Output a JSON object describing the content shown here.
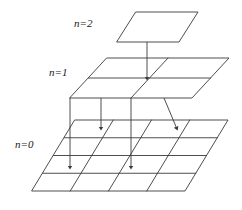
{
  "figure": {
    "background_color": "#ffffff",
    "line_color": "#3a3a3a",
    "text_color": "#1a1a1a"
  },
  "labels": [
    {
      "id": "n2",
      "variable": "n",
      "equals": "=",
      "value": "2",
      "text": "n=2"
    },
    {
      "id": "n1",
      "variable": "n",
      "equals": "=",
      "value": "1",
      "text": "n=1"
    },
    {
      "id": "n0",
      "variable": "n",
      "equals": "=",
      "value": "0",
      "text": "n=0"
    }
  ],
  "planes": [
    {
      "id": "n2",
      "level": 2,
      "divisions": 1,
      "cells": 1,
      "corners": {
        "top_left": [
          136,
          12
        ],
        "top_right": [
          198,
          12
        ],
        "bottom_right": [
          179,
          42
        ],
        "bottom_left": [
          117,
          42
        ]
      }
    },
    {
      "id": "n1",
      "level": 1,
      "divisions": 2,
      "cells": 4,
      "corners": {
        "top_left": [
          107,
          58
        ],
        "top_right": [
          229,
          58
        ],
        "bottom_right": [
          192,
          98
        ],
        "bottom_left": [
          70,
          98
        ]
      }
    },
    {
      "id": "n0",
      "level": 0,
      "divisions": 4,
      "cells": 16,
      "corners": {
        "top_left": [
          75,
          120
        ],
        "top_right": [
          228,
          120
        ],
        "bottom_right": [
          185,
          191
        ],
        "bottom_left": [
          32,
          191
        ]
      }
    }
  ],
  "arrows": [
    {
      "id": "arrow-n2-to-n1",
      "from": [
        147,
        42
      ],
      "to": [
        147,
        79
      ]
    },
    {
      "id": "arrow-n1-to-n0-a",
      "from": [
        70,
        98
      ],
      "to": [
        70,
        168
      ]
    },
    {
      "id": "arrow-n1-to-n0-b",
      "from": [
        101,
        98
      ],
      "to": [
        101,
        129
      ]
    },
    {
      "id": "arrow-n1-to-n0-c",
      "from": [
        131,
        98
      ],
      "to": [
        131,
        168
      ]
    },
    {
      "id": "arrow-n1-to-n0-d",
      "from": [
        164,
        98
      ],
      "to": [
        177,
        129
      ]
    }
  ]
}
